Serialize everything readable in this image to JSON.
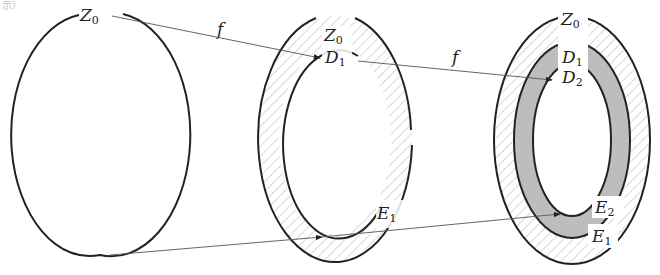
{
  "caption_fragment": "示）",
  "colors": {
    "stroke": "#222222",
    "hatch": "#9a9a9a",
    "shaded_ring": "#bdbdbd",
    "arrow": "#555555"
  },
  "map_label": "f",
  "figures": [
    {
      "id": "original",
      "labels": [
        {
          "base": "Z",
          "sub": "0"
        }
      ]
    },
    {
      "id": "first-image",
      "labels": [
        {
          "base": "Z",
          "sub": "0"
        },
        {
          "base": "D",
          "sub": "1"
        },
        {
          "base": "E",
          "sub": "1"
        }
      ]
    },
    {
      "id": "second-image",
      "labels": [
        {
          "base": "Z",
          "sub": "0"
        },
        {
          "base": "D",
          "sub": "1"
        },
        {
          "base": "D",
          "sub": "2"
        },
        {
          "base": "E",
          "sub": "2"
        },
        {
          "base": "E",
          "sub": "1"
        }
      ]
    }
  ]
}
